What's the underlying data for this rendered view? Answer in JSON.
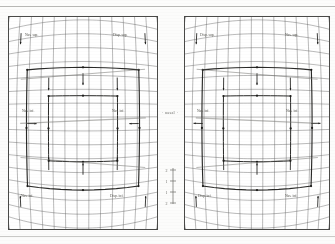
{
  "figure": {
    "type": "scanned-technical-figure",
    "title": "",
    "background_color": "#fcfcfb",
    "ink_color": "#3a3a38",
    "panel_border_color": "#4a4a48"
  },
  "center": {
    "label": "· nasal ·",
    "scalebar_ticks": [
      "2",
      "1",
      "1",
      "2"
    ]
  },
  "scan_artifacts": {
    "top_rule_color": "#b9b9b6",
    "bottom_rule_color": "#c9c9c6"
  },
  "panels": [
    {
      "id": "panel-left",
      "name": "left-eye-distortion-grid",
      "labels": [
        {
          "id": "lbl-l-tl",
          "text": "Nas. sup.",
          "x": 16,
          "y": 19,
          "size": 3.6
        },
        {
          "id": "lbl-l-tr",
          "text": "Disp. sup.",
          "x": 104,
          "y": 19,
          "size": 3.6
        },
        {
          "id": "lbl-l-ml",
          "text": "Nas. inf.",
          "x": 13,
          "y": 95,
          "size": 3.6
        },
        {
          "id": "lbl-l-mr",
          "text": "Nas. inf.",
          "x": 103,
          "y": 95,
          "size": 3.6
        },
        {
          "id": "lbl-l-bl",
          "text": "Nas. inf.",
          "x": 12,
          "y": 180,
          "size": 3.6
        },
        {
          "id": "lbl-l-br",
          "text": "Disp. inf.",
          "x": 101,
          "y": 180,
          "size": 3.6
        }
      ]
    },
    {
      "id": "panel-right",
      "name": "right-eye-distortion-grid",
      "labels": [
        {
          "id": "lbl-r-tl",
          "text": "Disp. sup.",
          "x": 15,
          "y": 19,
          "size": 3.6
        },
        {
          "id": "lbl-r-tr",
          "text": "Nas. sup.",
          "x": 100,
          "y": 19,
          "size": 3.6
        },
        {
          "id": "lbl-r-ml",
          "text": "Nas. inf.",
          "x": 12,
          "y": 95,
          "size": 3.6
        },
        {
          "id": "lbl-r-mr",
          "text": "Nas. inf.",
          "x": 101,
          "y": 95,
          "size": 3.6
        },
        {
          "id": "lbl-r-bl",
          "text": "Disp. inf.",
          "x": 13,
          "y": 180,
          "size": 3.6
        },
        {
          "id": "lbl-r-br",
          "text": "Nas. inf.",
          "x": 100,
          "y": 180,
          "size": 3.6
        }
      ]
    }
  ],
  "chart_data": {
    "type": "line",
    "title": "",
    "xlabel": "",
    "ylabel": "",
    "grid": {
      "columns": 13,
      "rows": 17,
      "curvature_top": -22,
      "curvature_bottom": 26,
      "curvature_side": 9,
      "grid_on": true
    },
    "inner_frames": [
      {
        "name": "outer-bold-frame",
        "x0": 0.14,
        "y0": 0.26,
        "x1": 0.86,
        "y1": 0.78
      },
      {
        "name": "inner-bold-frame",
        "x0": 0.28,
        "y0": 0.38,
        "x1": 0.72,
        "y1": 0.66
      }
    ],
    "vectors": [
      {
        "x": 0.28,
        "y": 0.3,
        "dx": 0.0,
        "dy": 0.055
      },
      {
        "x": 0.5,
        "y": 0.285,
        "dx": 0.0,
        "dy": 0.05
      },
      {
        "x": 0.72,
        "y": 0.3,
        "dx": 0.0,
        "dy": 0.055
      },
      {
        "x": 0.145,
        "y": 0.5,
        "dx": 0.06,
        "dy": 0.0
      },
      {
        "x": 0.855,
        "y": 0.5,
        "dx": -0.06,
        "dy": 0.0
      },
      {
        "x": 0.28,
        "y": 0.7,
        "dx": 0.0,
        "dy": -0.055
      },
      {
        "x": 0.5,
        "y": 0.715,
        "dx": 0.0,
        "dy": -0.05
      },
      {
        "x": 0.72,
        "y": 0.7,
        "dx": 0.0,
        "dy": -0.055
      },
      {
        "x": 0.09,
        "y": 0.09,
        "dx": 0.0,
        "dy": 0.05
      },
      {
        "x": 0.91,
        "y": 0.09,
        "dx": 0.0,
        "dy": 0.05
      },
      {
        "x": 0.09,
        "y": 0.88,
        "dx": 0.0,
        "dy": -0.05
      },
      {
        "x": 0.91,
        "y": 0.88,
        "dx": 0.0,
        "dy": -0.05
      }
    ],
    "axis_ranges": {
      "xlim": [
        0,
        1
      ],
      "ylim": [
        0,
        1
      ]
    },
    "legend_position": "none"
  }
}
